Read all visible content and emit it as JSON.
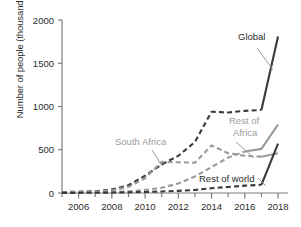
{
  "chart_data": {
    "type": "line",
    "title": "",
    "xlabel": "",
    "ylabel": "Number of people (thousands)",
    "xlim": [
      2005,
      2018.6
    ],
    "ylim": [
      0,
      2000
    ],
    "yticks": [
      0,
      500,
      1000,
      1500,
      2000
    ],
    "ytick_labels": [
      "0",
      "500",
      "1000",
      "1500",
      "2000"
    ],
    "xticks": [
      2006,
      2008,
      2010,
      2012,
      2014,
      2016,
      2018
    ],
    "xtick_labels": [
      "2006",
      "2008",
      "2010",
      "2012",
      "2014",
      "2016",
      "2018"
    ],
    "x_minor_ticks": [
      2005,
      2007,
      2009,
      2011,
      2013,
      2015,
      2017
    ],
    "grid": false,
    "legend": "inline-annotations",
    "x": [
      2005,
      2006,
      2007,
      2008,
      2009,
      2010,
      2011,
      2012,
      2013,
      2014,
      2015,
      2016,
      2017,
      2018
    ],
    "series": [
      {
        "name": "Global",
        "color": "#3a3a3a",
        "style": "dashed-then-solid",
        "solid_from": 2017,
        "label": "Global",
        "values": [
          10,
          15,
          20,
          40,
          90,
          200,
          330,
          430,
          590,
          940,
          930,
          950,
          960,
          1810
        ]
      },
      {
        "name": "South Africa",
        "color": "#9a9a9a",
        "style": "dashed-then-solid",
        "solid_from": 2017,
        "label": "South Africa",
        "values": [
          8,
          12,
          16,
          30,
          70,
          170,
          360,
          355,
          350,
          550,
          460,
          430,
          420,
          460
        ]
      },
      {
        "name": "Rest of Africa",
        "color": "#9a9a9a",
        "style": "dashed-then-solid",
        "solid_from": 2016,
        "label": "Rest of Africa",
        "values": [
          2,
          3,
          5,
          10,
          20,
          35,
          60,
          110,
          190,
          300,
          410,
          480,
          510,
          790
        ]
      },
      {
        "name": "Rest of world",
        "color": "#3a3a3a",
        "style": "dashed-then-solid",
        "solid_from": 2017,
        "label": "Rest of world",
        "values": [
          1,
          2,
          3,
          5,
          8,
          12,
          18,
          25,
          35,
          55,
          70,
          85,
          95,
          570
        ]
      }
    ],
    "annotations": [
      {
        "text": "Global",
        "color": "#2b2b2b",
        "x": 238,
        "y": 40
      },
      {
        "text": "Rest of",
        "color": "#9a9a9a",
        "x": 229,
        "y": 124
      },
      {
        "text": "Africa",
        "color": "#9a9a9a",
        "x": 233,
        "y": 136
      },
      {
        "text": "South Africa",
        "color": "#9a9a9a",
        "x": 115,
        "y": 145
      },
      {
        "text": "Rest of world",
        "color": "#2b2b2b",
        "x": 199,
        "y": 182
      }
    ]
  }
}
